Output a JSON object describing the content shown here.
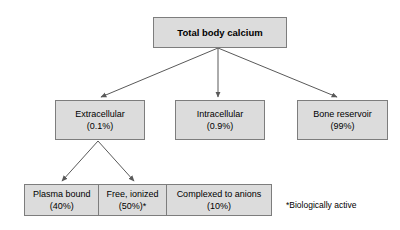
{
  "diagram": {
    "title_node": {
      "label": "Total body calcium"
    },
    "level2": [
      {
        "name": "Extracellular",
        "value": "(0.1%)"
      },
      {
        "name": "Intracellular",
        "value": "(0.9%)"
      },
      {
        "name": "Bone reservoir",
        "value": "(99%)"
      }
    ],
    "level3": [
      {
        "name": "Plasma bound",
        "value": "(40%)"
      },
      {
        "name": "Free, ionized",
        "value": "(50%)*"
      },
      {
        "name": "Complexed to anions",
        "value": "(10%)"
      }
    ],
    "footnote": "*Biologically active",
    "colors": {
      "node_fill": "#dcdcdc",
      "node_border": "#7d7d7d",
      "arrow": "#595959",
      "text": "#000000",
      "background": "#ffffff"
    }
  }
}
